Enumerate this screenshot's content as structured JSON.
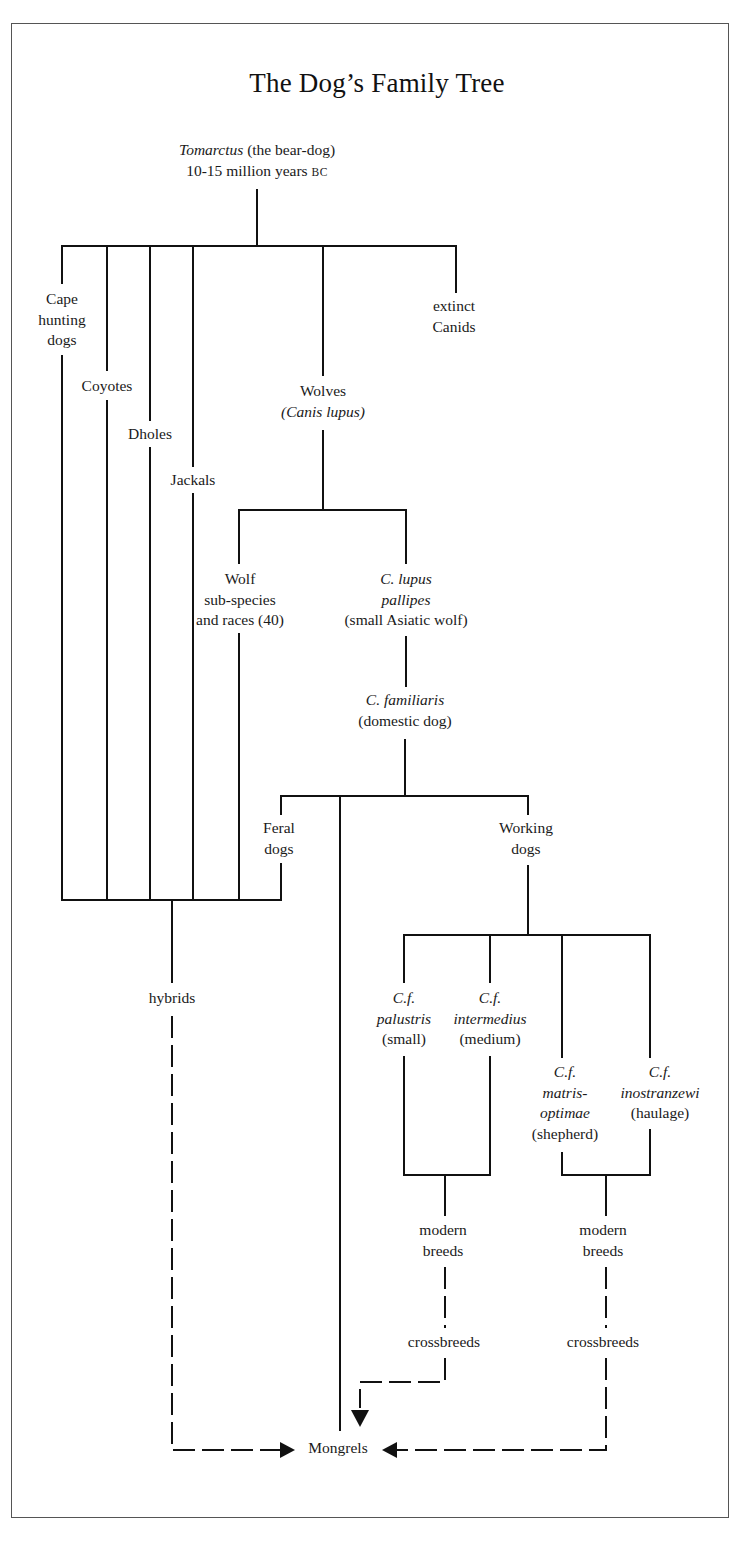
{
  "title": "The Dog’s Family Tree",
  "root": {
    "name_italic": "Tomarctus",
    "name_rest": " (the bear-dog)",
    "age": "10-15 million years ",
    "age_era": "BC"
  },
  "nodes": {
    "cape_hunting_dogs": [
      "Cape",
      "hunting",
      "dogs"
    ],
    "coyotes": [
      "Coyotes"
    ],
    "dholes": [
      "Dholes"
    ],
    "jackals": [
      "Jackals"
    ],
    "wolves": [
      "Wolves",
      "(Canis lupus)"
    ],
    "extinct_canids": [
      "extinct",
      "Canids"
    ],
    "wolf_subspecies": [
      "Wolf",
      "sub-species",
      "and races (40)"
    ],
    "c_lupus_pallipes": [
      "C. lupus",
      "pallipes",
      "(small Asiatic wolf)"
    ],
    "c_familiaris": [
      "C. familiaris",
      "(domestic dog)"
    ],
    "feral_dogs": [
      "Feral",
      "dogs"
    ],
    "working_dogs": [
      "Working",
      "dogs"
    ],
    "hybrids": [
      "hybrids"
    ],
    "cf_palustris": [
      "C.f.",
      "palustris",
      "(small)"
    ],
    "cf_intermedius": [
      "C.f.",
      "intermedius",
      "(medium)"
    ],
    "cf_matris_optimae": [
      "C.f.",
      "matris-",
      "optimae",
      "(shepherd)"
    ],
    "cf_inostranzewi": [
      "C.f.",
      "inostranzewi",
      "(haulage)"
    ],
    "modern_breeds_left": [
      "modern",
      "breeds"
    ],
    "modern_breeds_right": [
      "modern",
      "breeds"
    ],
    "crossbreeds_left": [
      "crossbreeds"
    ],
    "crossbreeds_right": [
      "crossbreeds"
    ],
    "mongrels": [
      "Mongrels"
    ]
  },
  "legend": {
    "solid_line": "direct descent",
    "dashed_line": "interbreeding / crossing"
  },
  "colors": {
    "line": "#111111",
    "frame": "#555555",
    "background": "#ffffff"
  }
}
